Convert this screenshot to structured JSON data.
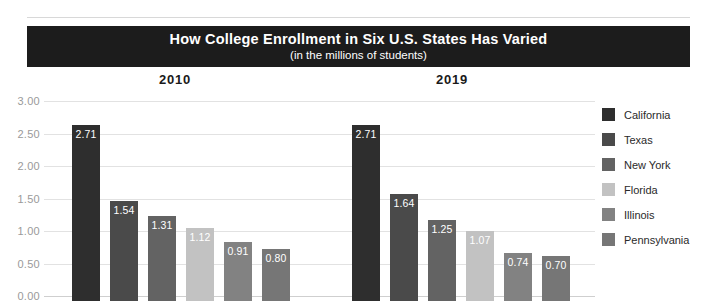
{
  "header": {
    "title": "How College Enrollment in Six U.S. States Has Varied",
    "subtitle": "(in the millions of students)"
  },
  "chart_data": {
    "type": "bar",
    "title": "How College Enrollment in Six U.S. States Has Varied",
    "subtitle": "(in the millions of students)",
    "xlabel": "",
    "ylabel": "",
    "ylim": [
      0,
      3
    ],
    "yticks": [
      "0.00",
      "0.50",
      "1.00",
      "1.50",
      "2.00",
      "2.50",
      "3.00"
    ],
    "ytick_values": [
      0,
      0.5,
      1,
      1.5,
      2,
      2.5,
      3
    ],
    "grid": true,
    "legend_position": "right",
    "categories": [
      "2010",
      "2019"
    ],
    "series": [
      {
        "name": "California",
        "color": "#2e2e2e",
        "values": [
          2.71,
          2.71
        ],
        "labels": [
          "2.71",
          "2.71"
        ]
      },
      {
        "name": "Texas",
        "color": "#4a4a4a",
        "values": [
          1.54,
          1.64
        ],
        "labels": [
          "1.54",
          "1.64"
        ]
      },
      {
        "name": "New York",
        "color": "#636363",
        "values": [
          1.31,
          1.25
        ],
        "labels": [
          "1.31",
          "1.25"
        ]
      },
      {
        "name": "Florida",
        "color": "#c2c2c2",
        "values": [
          1.12,
          1.07
        ],
        "labels": [
          "1.12",
          "1.07"
        ]
      },
      {
        "name": "Illinois",
        "color": "#828282",
        "values": [
          0.91,
          0.74
        ],
        "labels": [
          "0.91",
          "0.74"
        ]
      },
      {
        "name": "Pennsylvania",
        "color": "#767676",
        "values": [
          0.8,
          0.7
        ],
        "labels": [
          "0.80",
          "0.70"
        ]
      }
    ]
  }
}
